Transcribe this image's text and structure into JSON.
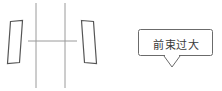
{
  "diagram": {
    "background_color": "#ffffff",
    "line_color": "#555555",
    "grid_color": "#9a9a9a",
    "callout_border_color": "#6b6b6b",
    "text_color": "#3a3a3a",
    "left_wheel": {
      "name": "left-wheel",
      "points": "10.5,21.5 22.5,20.5 19.5,62.5 7.5,63.5"
    },
    "right_wheel": {
      "name": "right-wheel",
      "points": "81.5,20.5 93.5,21.5 96.5,63.5 84.5,62.5"
    },
    "axis_vertical_left": {
      "name": "vertical-reference-line-left",
      "x": 36,
      "y1": 3,
      "y2": 88
    },
    "axis_vertical_right": {
      "name": "vertical-reference-line-right",
      "x": 65,
      "y1": 3,
      "y2": 88
    },
    "axis_horizontal": {
      "name": "horizontal-reference-line",
      "y": 41,
      "x1": 28,
      "x2": 77
    },
    "callout": {
      "name": "callout-box",
      "label": "前束过大",
      "box_x": 138,
      "box_y": 29,
      "box_width": 75,
      "box_height": 27,
      "tail_points": "164,56 172,67 180,56"
    }
  }
}
